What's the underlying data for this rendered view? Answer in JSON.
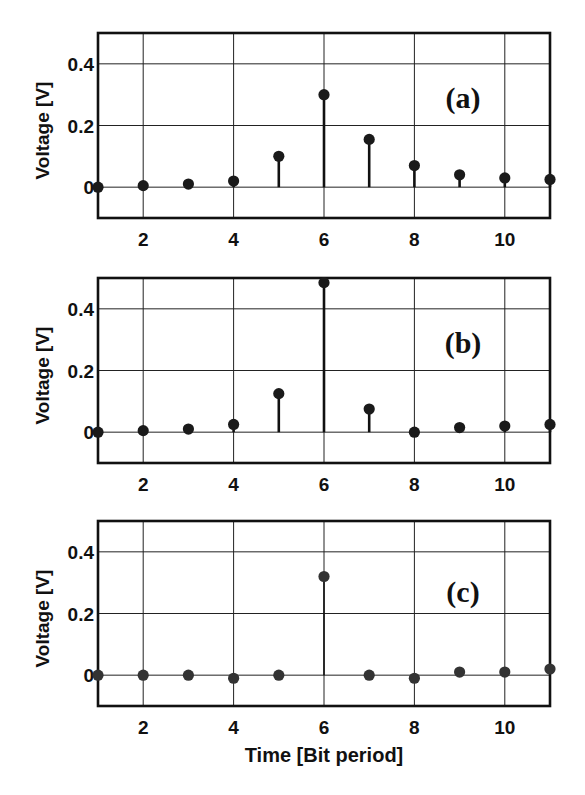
{
  "colors": {
    "background": "#ffffff",
    "line": "#111111",
    "marker": "#1a1a1a",
    "marker_c": "#333333"
  },
  "chart_data": [
    {
      "type": "stem",
      "panel_label": "(a)",
      "title": "",
      "xlabel": "",
      "ylabel": "Voltage [V]",
      "xlim": [
        1,
        11
      ],
      "ylim": [
        -0.1,
        0.5
      ],
      "xticks": [
        2,
        4,
        6,
        8,
        10
      ],
      "xtick_labels": [
        "2",
        "4",
        "6",
        "8",
        "10"
      ],
      "yticks": [
        0,
        0.2,
        0.4
      ],
      "ytick_labels": [
        "0",
        "0.2",
        "0.4"
      ],
      "grid": true,
      "x": [
        1,
        2,
        3,
        4,
        5,
        6,
        7,
        8,
        9,
        10,
        11
      ],
      "values": [
        0.0,
        0.005,
        0.01,
        0.02,
        0.1,
        0.3,
        0.155,
        0.07,
        0.04,
        0.03,
        0.025
      ]
    },
    {
      "type": "stem",
      "panel_label": "(b)",
      "title": "",
      "xlabel": "",
      "ylabel": "Voltage [V]",
      "xlim": [
        1,
        11
      ],
      "ylim": [
        -0.1,
        0.5
      ],
      "xticks": [
        2,
        4,
        6,
        8,
        10
      ],
      "xtick_labels": [
        "2",
        "4",
        "6",
        "8",
        "10"
      ],
      "yticks": [
        0,
        0.2,
        0.4
      ],
      "ytick_labels": [
        "0",
        "0.2",
        "0.4"
      ],
      "grid": true,
      "x": [
        1,
        2,
        3,
        4,
        5,
        6,
        7,
        8,
        9,
        10,
        11
      ],
      "values": [
        0.0,
        0.005,
        0.01,
        0.025,
        0.125,
        0.485,
        0.075,
        0.0,
        0.015,
        0.02,
        0.025
      ]
    },
    {
      "type": "stem",
      "panel_label": "(c)",
      "title": "",
      "xlabel": "Time [Bit period]",
      "ylabel": "Voltage [V]",
      "xlim": [
        1,
        11
      ],
      "ylim": [
        -0.1,
        0.5
      ],
      "xticks": [
        2,
        4,
        6,
        8,
        10
      ],
      "xtick_labels": [
        "2",
        "4",
        "6",
        "8",
        "10"
      ],
      "yticks": [
        0,
        0.2,
        0.4
      ],
      "ytick_labels": [
        "0",
        "0.2",
        "0.4"
      ],
      "grid": true,
      "x": [
        1,
        2,
        3,
        4,
        5,
        6,
        7,
        8,
        9,
        10,
        11
      ],
      "values": [
        0.0,
        0.0,
        0.0,
        -0.01,
        0.0,
        0.32,
        0.0,
        -0.01,
        0.01,
        0.01,
        0.02
      ]
    }
  ],
  "layout": {
    "panels": [
      {
        "left": 98,
        "right": 550,
        "top": 33,
        "bottom": 218
      },
      {
        "left": 98,
        "right": 550,
        "top": 278,
        "bottom": 463
      },
      {
        "left": 98,
        "right": 550,
        "top": 521,
        "bottom": 706
      }
    ]
  }
}
